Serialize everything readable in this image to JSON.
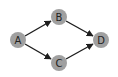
{
  "diagram": {
    "type": "directed-graph",
    "colors": {
      "node_fill": "#a0a0a0",
      "edge": "#1e1e1e",
      "label": "#222222",
      "background": "#ffffff"
    },
    "nodes": [
      {
        "id": "A",
        "label": "A",
        "x": 18,
        "y": 40
      },
      {
        "id": "B",
        "label": "B",
        "x": 59,
        "y": 17
      },
      {
        "id": "C",
        "label": "C",
        "x": 59,
        "y": 63
      },
      {
        "id": "D",
        "label": "D",
        "x": 101,
        "y": 40
      }
    ],
    "edges": [
      {
        "from": "A",
        "to": "B"
      },
      {
        "from": "A",
        "to": "C"
      },
      {
        "from": "B",
        "to": "D"
      },
      {
        "from": "C",
        "to": "D"
      }
    ]
  }
}
